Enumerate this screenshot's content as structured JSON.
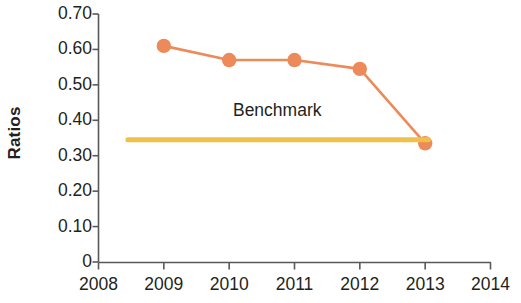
{
  "chart_data": {
    "type": "line",
    "title": "",
    "xlabel": "",
    "ylabel": "Ratios",
    "xlim": [
      2008,
      2014
    ],
    "ylim": [
      0,
      0.7
    ],
    "grid": false,
    "legend": "none",
    "x_ticks": [
      "2008",
      "2009",
      "2010",
      "2011",
      "2012",
      "2013",
      "2014"
    ],
    "y_ticks": [
      "0.70",
      "0.60",
      "0.50",
      "0.40",
      "0.30",
      "0.20",
      "0.10",
      "0"
    ],
    "y_tick_values": [
      0.7,
      0.6,
      0.5,
      0.4,
      0.3,
      0.2,
      0.1,
      0
    ],
    "series": [
      {
        "name": "Ratios",
        "type": "line",
        "color": "#EC8B59",
        "marker": "circle",
        "x": [
          2009,
          2010,
          2011,
          2012,
          2013
        ],
        "values": [
          0.61,
          0.57,
          0.57,
          0.545,
          0.335
        ]
      },
      {
        "name": "Benchmark",
        "type": "line",
        "color": "#F0C04A",
        "marker": "none",
        "x": [
          2008.45,
          2013.05
        ],
        "values": [
          0.345,
          0.345
        ]
      }
    ],
    "annotations": [
      {
        "text": "Benchmark",
        "x": 2010.9,
        "y": 0.425
      }
    ]
  },
  "axis": {
    "y_title": "Ratios"
  }
}
